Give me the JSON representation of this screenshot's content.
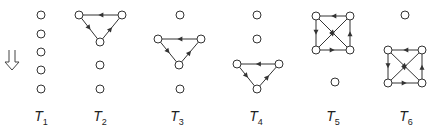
{
  "colors": {
    "stroke": "#333333",
    "node_fill": "#ffffff",
    "label": "#222222",
    "arrow_symbol": "#444444"
  },
  "down_arrow": {
    "symbol": "double-down-arrow",
    "x": 12,
    "y": 60
  },
  "node_radius": 4,
  "panels": [
    {
      "id": "T1",
      "label_main": "T",
      "label_sub": "1",
      "label_x": 41,
      "nodes": [
        [
          41,
          15
        ],
        [
          41,
          34
        ],
        [
          41,
          52
        ],
        [
          41,
          70
        ],
        [
          41,
          89
        ]
      ],
      "edges": []
    },
    {
      "id": "T2",
      "label_main": "T",
      "label_sub": "2",
      "label_x": 100,
      "nodes": [
        [
          79,
          15
        ],
        [
          122,
          15
        ],
        [
          100,
          42
        ],
        [
          100,
          65
        ],
        [
          100,
          89
        ]
      ],
      "edges": [
        [
          1,
          0
        ],
        [
          0,
          2
        ],
        [
          2,
          1
        ]
      ]
    },
    {
      "id": "T3",
      "label_main": "T",
      "label_sub": "3",
      "label_x": 177,
      "nodes": [
        [
          180,
          15
        ],
        [
          158,
          39
        ],
        [
          201,
          39
        ],
        [
          179,
          65
        ],
        [
          180,
          89
        ]
      ],
      "edges": [
        [
          2,
          1
        ],
        [
          1,
          3
        ],
        [
          3,
          2
        ]
      ]
    },
    {
      "id": "T4",
      "label_main": "T",
      "label_sub": "4",
      "label_x": 256,
      "nodes": [
        [
          257,
          15
        ],
        [
          257,
          39
        ],
        [
          237,
          64
        ],
        [
          279,
          64
        ],
        [
          257,
          89
        ]
      ],
      "edges": [
        [
          3,
          2
        ],
        [
          2,
          4
        ],
        [
          4,
          3
        ]
      ]
    },
    {
      "id": "T5",
      "label_main": "T",
      "label_sub": "5",
      "label_x": 333,
      "nodes": [
        [
          316,
          16
        ],
        [
          350,
          16
        ],
        [
          316,
          50
        ],
        [
          350,
          50
        ],
        [
          335,
          82
        ]
      ],
      "edges": [
        [
          1,
          0
        ],
        [
          0,
          2
        ],
        [
          2,
          3
        ],
        [
          3,
          1
        ],
        [
          2,
          1
        ],
        [
          0,
          3
        ]
      ]
    },
    {
      "id": "T6",
      "label_main": "T",
      "label_sub": "6",
      "label_x": 406,
      "nodes": [
        [
          405,
          15
        ],
        [
          388,
          50
        ],
        [
          422,
          50
        ],
        [
          388,
          83
        ],
        [
          422,
          83
        ]
      ],
      "edges": [
        [
          2,
          1
        ],
        [
          1,
          3
        ],
        [
          3,
          4
        ],
        [
          4,
          2
        ],
        [
          3,
          2
        ],
        [
          1,
          4
        ]
      ]
    }
  ],
  "label_y": 108
}
